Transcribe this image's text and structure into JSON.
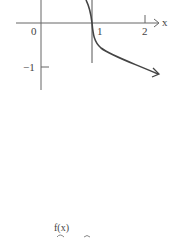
{
  "graph": {
    "axis_x_label": "x",
    "tick_labels": {
      "zero": "0",
      "one": "1",
      "two": "2",
      "neg_one": "−1"
    },
    "function_label": "f(x)"
  },
  "colors": {
    "axis": "#555555",
    "curve": "#444444",
    "text": "#444444"
  }
}
